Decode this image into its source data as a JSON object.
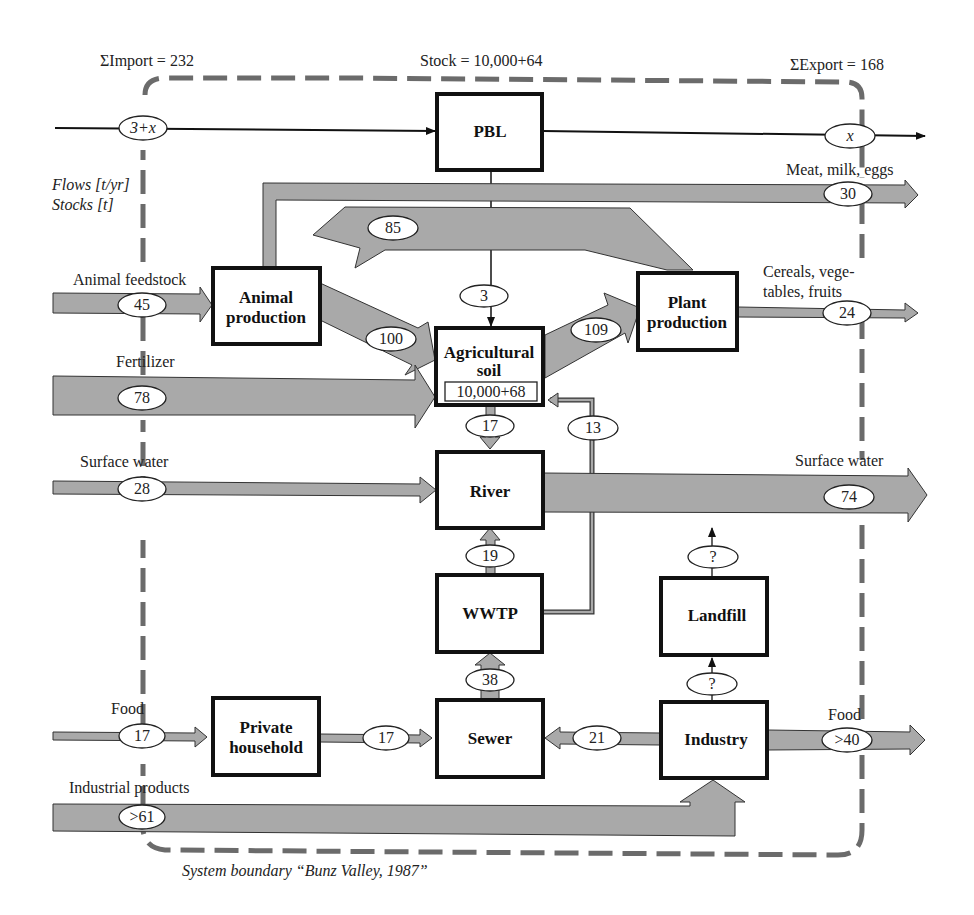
{
  "header": {
    "import_total": "ΣImport = 232",
    "stock_total": "Stock = 10,000+64",
    "export_total": "ΣExport = 168",
    "units_flows": "Flows [t/yr]",
    "units_stocks": "Stocks [t]"
  },
  "boundary_caption": "System boundary “Bunz Valley, 1987”",
  "processes": {
    "pbl": "PBL",
    "animal_production": [
      "Animal",
      "production"
    ],
    "plant_production": [
      "Plant",
      "production"
    ],
    "agricultural_soil": [
      "Agricultural",
      "soil"
    ],
    "agricultural_soil_stock": "10,000+68",
    "river": "River",
    "wwtp": "WWTP",
    "landfill": "Landfill",
    "private_household": [
      "Private",
      "household"
    ],
    "sewer": "Sewer",
    "industry": "Industry"
  },
  "flow_labels": {
    "animal_feedstock": "Animal feedstock",
    "fertilizer": "Fertilizer",
    "surface_water_in": "Surface water",
    "food_in": "Food",
    "industrial_products": "Industrial products",
    "meat_milk_eggs": "Meat, milk, eggs",
    "cereals_1": "Cereals, vege-",
    "cereals_2": "tables, fruits",
    "surface_water_out": "Surface water",
    "food_out": "Food"
  },
  "flows": {
    "import_pbl": "3+x",
    "export_pbl": "x",
    "meat_milk_eggs": "30",
    "plant_to_animal": "85",
    "animal_feedstock": "45",
    "pbl_to_soil": "3",
    "animal_to_soil": "100",
    "soil_to_plant": "109",
    "cereals": "24",
    "fertilizer": "78",
    "soil_to_river": "17",
    "wwtp_to_soil": "13",
    "surface_water_in": "28",
    "surface_water_out": "74",
    "wwtp_to_river": "19",
    "landfill_out": "?",
    "industry_to_landfill": "?",
    "sewer_to_wwtp": "38",
    "food_in": "17",
    "household_to_sewer": "17",
    "industry_to_sewer": "21",
    "food_out": ">40",
    "industrial_products": ">61"
  },
  "colors": {
    "flow_fill": "#a9a9a9",
    "boundary": "#6b6b6b",
    "box_border": "#111111"
  }
}
